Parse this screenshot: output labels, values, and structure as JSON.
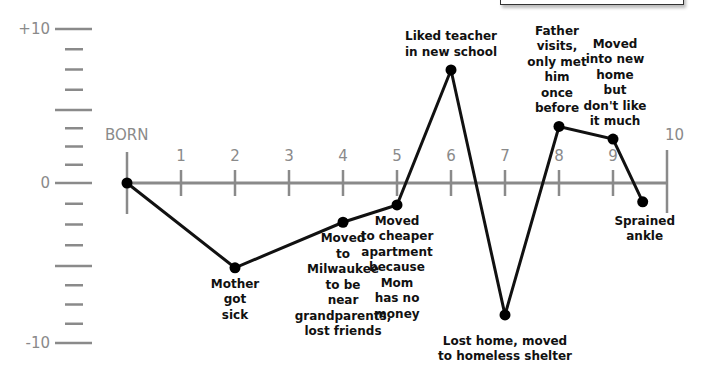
{
  "chart_data": {
    "type": "line",
    "title": "",
    "xlabel": "",
    "ylabel": "",
    "x_tick_labels": [
      "BORN",
      "1",
      "2",
      "3",
      "4",
      "5",
      "6",
      "7",
      "8",
      "9",
      "10"
    ],
    "y_tick_labels": [
      {
        "label": "+10",
        "value": 10
      },
      {
        "label": "0",
        "value": 0
      },
      {
        "label": "-10",
        "value": -10
      }
    ],
    "xlim": [
      0,
      10
    ],
    "ylim": [
      -10,
      10
    ],
    "grid": false,
    "legend": null,
    "points": [
      {
        "x": 0,
        "y": 0,
        "label": ""
      },
      {
        "x": 2,
        "y": -5.4,
        "label": "Mother\ngot\nsick"
      },
      {
        "x": 4,
        "y": -2.5,
        "label": "Moved\nto\nMilwaukee\nto be\nnear\ngrandparents,\nlost friends"
      },
      {
        "x": 5,
        "y": -1.4,
        "label": "Moved\nto cheaper\napartment\nbecause\nMom\nhas no\nmoney"
      },
      {
        "x": 6,
        "y": 7.2,
        "label": "Liked teacher\nin new school"
      },
      {
        "x": 7,
        "y": -8.4,
        "label": "Lost home, moved\nto homeless shelter"
      },
      {
        "x": 8,
        "y": 3.6,
        "label": "Father\nvisits,\nonly met\nhim\nonce\nbefore"
      },
      {
        "x": 9,
        "y": 2.8,
        "label": "Moved\ninto new\nhome\nbut\ndon't like\nit much"
      },
      {
        "x": 9.55,
        "y": -1.2,
        "label": "Sprained\nankle"
      }
    ]
  },
  "colors": {
    "axis": "#8a8a8a",
    "line": "#111111",
    "point": "#000000",
    "text": "#111111"
  }
}
